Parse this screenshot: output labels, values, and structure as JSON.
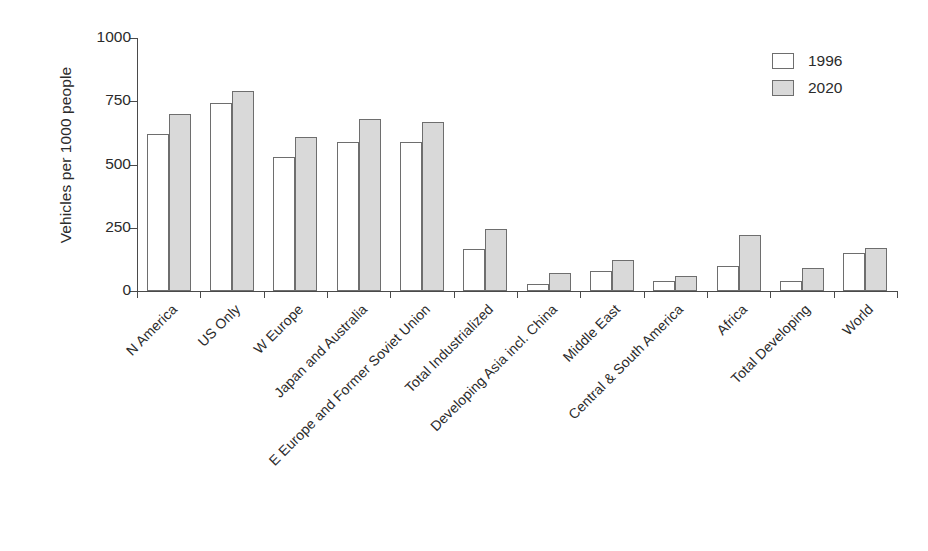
{
  "chart_data": {
    "type": "bar",
    "title": "",
    "xlabel": "",
    "ylabel": "Vehicles per 1000 people",
    "ylim": [
      0,
      1000
    ],
    "yticks": [
      0,
      250,
      500,
      750,
      1000
    ],
    "grid": false,
    "legend_position": "top-right",
    "categories": [
      "N America",
      "US Only",
      "W Europe",
      "Japan and Australia",
      "E Europe and Former Soviet Union",
      "Total Industrialized",
      "Developing Asia incl. China",
      "Middle East",
      "Central & South America",
      "Africa",
      "Total Developing",
      "World"
    ],
    "series": [
      {
        "name": "1996",
        "color": "#ffffff",
        "values": [
          620,
          745,
          530,
          590,
          588,
          168,
          28,
          78,
          38,
          100,
          40,
          150
        ]
      },
      {
        "name": "2020",
        "color": "#d9d9d9",
        "values": [
          700,
          790,
          610,
          680,
          668,
          245,
          72,
          122,
          60,
          220,
          92,
          170
        ]
      }
    ]
  },
  "legend": {
    "entries": [
      {
        "label": "1996",
        "swatch": "white-swatch"
      },
      {
        "label": "2020",
        "swatch": "gray-swatch"
      }
    ]
  },
  "axis": {
    "y_title": "Vehicles per 1000 people",
    "y_tick_labels": [
      "1000",
      "750",
      "500",
      "250",
      "0"
    ]
  }
}
